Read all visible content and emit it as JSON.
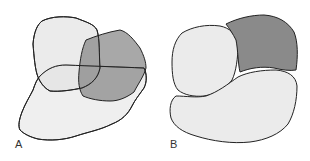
{
  "figure": {
    "panels": [
      {
        "label": "A",
        "description": "Overlapping regions",
        "shapes": [
          {
            "name": "light-region-upper",
            "fill": "#e6e6e6"
          },
          {
            "name": "light-region-lower",
            "fill": "#ebebeb"
          },
          {
            "name": "dark-region",
            "fill": "#8c8c8c"
          }
        ]
      },
      {
        "label": "B",
        "description": "Non-overlapping adjacent regions",
        "shapes": [
          {
            "name": "light-region-left",
            "fill": "#ebebeb"
          },
          {
            "name": "dark-region",
            "fill": "#8a8a8a"
          },
          {
            "name": "light-region-lower",
            "fill": "#ebebeb"
          }
        ]
      }
    ],
    "colors": {
      "outline": "#222222",
      "light": "#ebebeb",
      "dark": "#8c8c8c"
    }
  }
}
